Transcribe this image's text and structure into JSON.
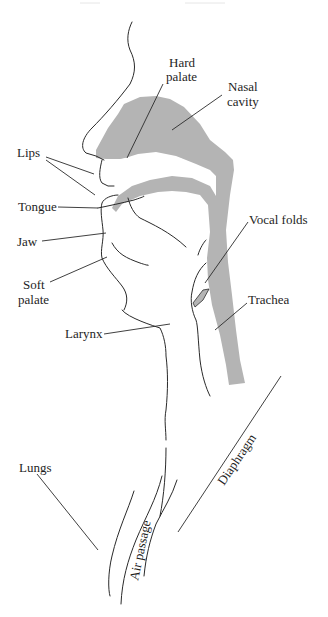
{
  "diagram": {
    "type": "anatomical-labeled-diagram",
    "colors": {
      "background": "#ffffff",
      "cavity_shading": "#b4b4b4",
      "line": "#2a2a2a",
      "text": "#1e1e1e"
    },
    "labels": {
      "hard_palate_1": "Hard",
      "hard_palate_2": "palate",
      "nasal_cavity_1": "Nasal",
      "nasal_cavity_2": "cavity",
      "lips": "Lips",
      "tongue": "Tongue",
      "jaw": "Jaw",
      "soft_palate_1": "Soft",
      "soft_palate_2": "palate",
      "vocal_folds": "Vocal folds",
      "trachea": "Trachea",
      "larynx": "Larynx",
      "lungs": "Lungs",
      "air_passage": "Air passage",
      "diaphragm": "Diaphragm"
    }
  }
}
